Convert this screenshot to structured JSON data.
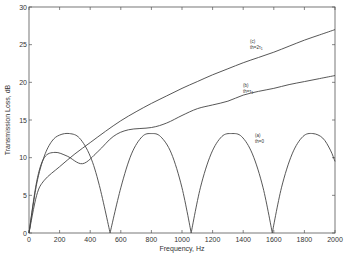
{
  "chart_data": {
    "type": "line",
    "title": "",
    "xlabel": "Frequency, Hz",
    "ylabel": "Transmission Loss, dB",
    "xlim": [
      0,
      2000
    ],
    "ylim": [
      0,
      30
    ],
    "xticks": [
      0,
      200,
      400,
      600,
      800,
      1000,
      1200,
      1400,
      1600,
      1800,
      2000
    ],
    "yticks": [
      0,
      5,
      10,
      15,
      20,
      25,
      30
    ],
    "grid": false,
    "legend": "none (inline annotations)",
    "line_color": "#444444",
    "series": [
      {
        "name": "(a) th=0",
        "label_line1": "(a)",
        "label_line2": "th=0",
        "x": [
          0,
          50,
          100,
          150,
          200,
          265,
          330,
          400,
          460,
          530,
          600,
          670,
          740,
          800,
          860,
          930,
          1000,
          1060,
          1120,
          1190,
          1260,
          1325,
          1390,
          1460,
          1530,
          1590,
          1650,
          1720,
          1790,
          1855,
          1920,
          1970,
          2000
        ],
        "y": [
          0,
          6.5,
          10.2,
          12.2,
          13.0,
          13.2,
          12.6,
          10.2,
          6.3,
          0,
          6.0,
          10.5,
          12.8,
          13.2,
          12.8,
          10.6,
          6.0,
          0,
          6.0,
          10.5,
          12.8,
          13.2,
          12.8,
          10.5,
          6.0,
          0,
          6.0,
          10.5,
          12.8,
          13.2,
          12.6,
          11.0,
          9.5
        ]
      },
      {
        "name": "(b) th=τ1",
        "label_line1": "(b)",
        "label_line2": "th=τ1",
        "x": [
          0,
          50,
          100,
          170,
          250,
          350,
          450,
          550,
          650,
          800,
          900,
          1000,
          1100,
          1200,
          1300,
          1400,
          1500,
          1600,
          1700,
          1800,
          1900,
          2000
        ],
        "y": [
          0,
          6.8,
          10.0,
          10.7,
          10.2,
          9.2,
          10.8,
          12.8,
          13.7,
          14.0,
          14.6,
          15.6,
          16.5,
          17.0,
          17.5,
          18.3,
          18.8,
          19.2,
          19.7,
          20.1,
          20.5,
          20.9
        ]
      },
      {
        "name": "(c) th=2τ1",
        "label_line1": "(c)",
        "label_line2": "th=2τ1",
        "x": [
          0,
          50,
          100,
          200,
          300,
          400,
          500,
          600,
          700,
          800,
          900,
          1000,
          1100,
          1200,
          1300,
          1400,
          1500,
          1600,
          1700,
          1800,
          1900,
          2000
        ],
        "y": [
          0,
          5.0,
          7.0,
          8.8,
          10.5,
          12.0,
          13.5,
          14.9,
          16.1,
          17.2,
          18.2,
          19.2,
          20.1,
          21.0,
          21.8,
          22.6,
          23.3,
          24.0,
          24.8,
          25.6,
          26.3,
          27.0
        ]
      }
    ],
    "annotations": [
      {
        "series": "(c)",
        "text": "(c) th=2τ1",
        "x": 1350,
        "y": 25.5
      },
      {
        "series": "(b)",
        "text": "(b) th=τ1",
        "x": 1280,
        "y": 20.2
      },
      {
        "series": "(a)",
        "text": "(a) th=0",
        "x": 1380,
        "y": 13.5
      }
    ]
  },
  "axes": {
    "xlabel": "Frequency, Hz",
    "ylabel": "Transmission Loss, dB",
    "xtick_labels": [
      "0",
      "200",
      "400",
      "600",
      "800",
      "1000",
      "1200",
      "1400",
      "1600",
      "1800",
      "2000"
    ],
    "ytick_labels": [
      "0",
      "5",
      "10",
      "15",
      "20",
      "25",
      "30"
    ]
  },
  "labels": {
    "a1": "(a)",
    "a2": "th=0",
    "b1": "(b)",
    "b2": "th=τ",
    "c1": "(c)",
    "c2": "th=2τ",
    "sub1": "1"
  }
}
